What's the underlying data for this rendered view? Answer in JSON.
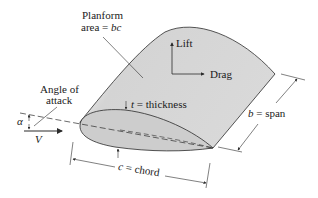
{
  "diagram": {
    "labels": {
      "planform_line1": "Planform",
      "planform_line2_prefix": "area = ",
      "planform_line2_var": "bc",
      "lift": "Lift",
      "drag": "Drag",
      "angle_line1": "Angle of",
      "angle_line2": "attack",
      "alpha": "α",
      "velocity": "V",
      "thickness_var": "t",
      "thickness_rest": " = thickness",
      "span_var": "b",
      "span_rest": " = span",
      "chord_var": "c",
      "chord_rest": " = chord"
    },
    "colors": {
      "wing_fill": "#d6d6d6",
      "wing_highlight": "#ececec",
      "airfoil_fill": "#cfcfcf",
      "line": "#2b2b2b",
      "background": "#ffffff"
    }
  }
}
